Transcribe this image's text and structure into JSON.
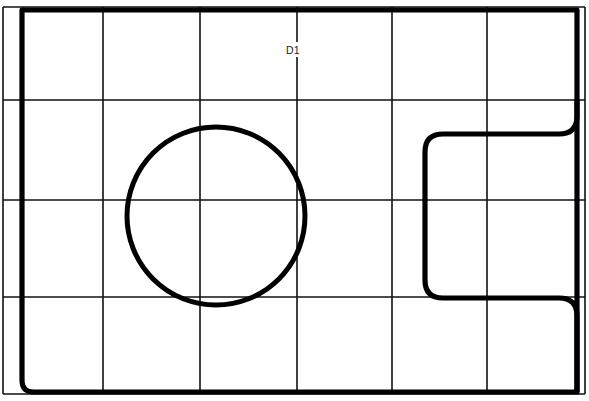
{
  "drawing": {
    "title": "D1",
    "canvas": {
      "width": 589,
      "height": 401,
      "background": "#ffffff"
    },
    "line_color": "#000000",
    "grid_color": "#111111",
    "labels": [
      {
        "id": "label-d1",
        "text": "D1",
        "x": 293,
        "y": 51,
        "anchor": "middle"
      }
    ],
    "grid": {
      "vertical_x": [
        3,
        103,
        200,
        297,
        392,
        487,
        585
      ],
      "horizontal_y": [
        7,
        100,
        200,
        297,
        394
      ]
    },
    "shapes": {
      "outer_frame": {
        "name": "outer-boundary",
        "left": 22,
        "top": 10,
        "right": 577,
        "bottom": 392,
        "corner_radius_bottom_left": 10
      },
      "circle": {
        "name": "circle-feature",
        "center_x": 216,
        "center_y": 216,
        "radius": 89
      },
      "bracket": {
        "name": "c-bracket-feature",
        "description": "right-side C shaped profile opening toward the right edge",
        "top_y": 134,
        "bottom_y": 298,
        "left_x": 425,
        "right_open_x": 589,
        "corner_radius": 18
      }
    }
  },
  "meta": {
    "label_count": 1,
    "shape_count": 3
  }
}
